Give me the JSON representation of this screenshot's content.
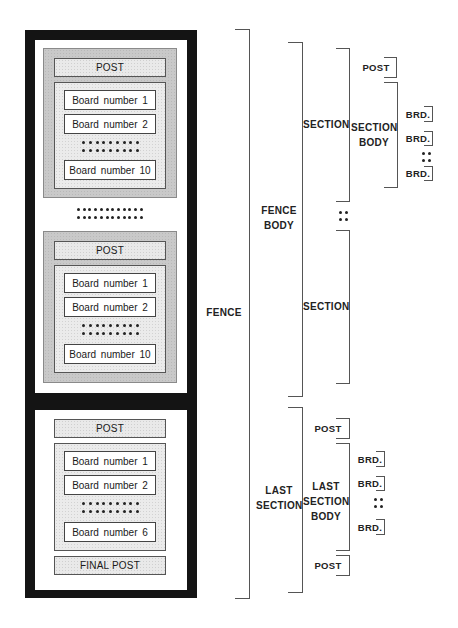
{
  "figure_label": "",
  "fence": {
    "sections": [
      {
        "post_label": "POST",
        "boards": [
          "Board number 1",
          "Board number 2",
          "Board number 10"
        ]
      },
      {
        "post_label": "POST",
        "boards": [
          "Board number 1",
          "Board number 2",
          "Board number 10"
        ]
      }
    ],
    "last_section": {
      "post_label": "POST",
      "boards": [
        "Board number 1",
        "Board number 2",
        "Board number 6"
      ],
      "final_post_label": "FINAL POST"
    }
  },
  "brackets": {
    "fence": "FENCE",
    "fence_body": [
      "FENCE",
      "BODY"
    ],
    "section": "SECTION",
    "section_2": "SECTION",
    "post": "POST",
    "section_body": [
      "SECTION",
      "BODY"
    ],
    "brd": "BRD.",
    "last_section": [
      "LAST",
      "SECTION"
    ],
    "last_section_body": [
      "LAST",
      "SECTION",
      "BODY"
    ],
    "last_post_top": "POST",
    "last_post_bottom": "POST"
  }
}
